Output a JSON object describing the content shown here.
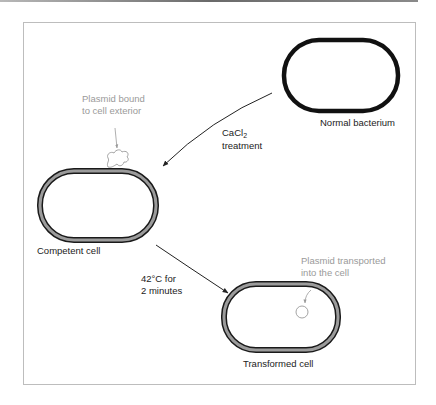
{
  "figure": {
    "colors": {
      "ink": "#222222",
      "annotation_gray": "#9a9a9a",
      "wall_gray": "#9b9b9b",
      "frame": "#bdbdbd"
    },
    "labels": {
      "normal_bacterium": "Normal bacterium",
      "cacl2_prefix": "CaCl",
      "cacl2_subscript": "2",
      "treatment": "treatment",
      "plasmid_bound_line1": "Plasmid bound",
      "plasmid_bound_line2": "to cell exterior",
      "competent_cell": "Competent cell",
      "heat_line1": "42°C for",
      "heat_line2": "2 minutes",
      "plasmid_transported_line1": "Plasmid transported",
      "plasmid_transported_line2": "into the cell",
      "transformed_cell": "Transformed cell"
    }
  }
}
